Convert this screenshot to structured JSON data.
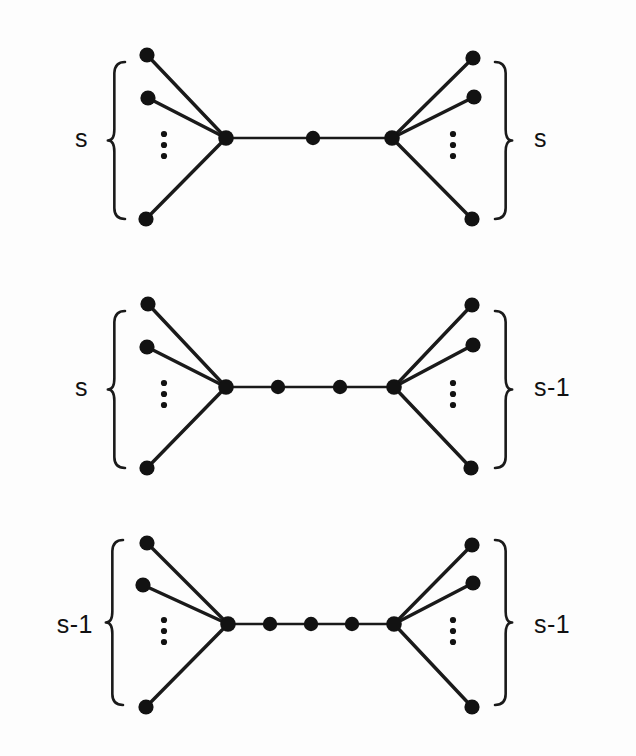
{
  "figure": {
    "background_color": "#fdfdfd",
    "ink_color": "#121212",
    "panel_count": 3,
    "ellipsis_glyph": "vertical-ellipsis",
    "panels": [
      {
        "id": "panel-top",
        "left_label": "s",
        "right_label": "s",
        "spine_internal_nodes": 1,
        "left_leaf_count_visible": 3,
        "right_leaf_count_visible": 3,
        "left_hub": {
          "x": 226,
          "y": 138
        },
        "right_hub": {
          "x": 392,
          "y": 138
        },
        "spine_nodes": [
          {
            "x": 313,
            "y": 138
          }
        ],
        "left_leaves": [
          {
            "x": 147,
            "y": 55
          },
          {
            "x": 148,
            "y": 98
          },
          {
            "x": 146,
            "y": 219
          }
        ],
        "right_leaves": [
          {
            "x": 473,
            "y": 58
          },
          {
            "x": 474,
            "y": 97
          },
          {
            "x": 472,
            "y": 219
          }
        ],
        "left_brace": {
          "x": 112,
          "top": 62,
          "bottom": 219
        },
        "right_brace": {
          "x": 508,
          "top": 62,
          "bottom": 219
        },
        "left_label_pos": {
          "x": 88,
          "y": 147
        },
        "right_label_pos": {
          "x": 534,
          "y": 147
        },
        "left_ellipsis": {
          "x": 164,
          "y": 145
        },
        "right_ellipsis": {
          "x": 453,
          "y": 145
        }
      },
      {
        "id": "panel-middle",
        "left_label": "s",
        "right_label": "s-1",
        "spine_internal_nodes": 2,
        "left_leaf_count_visible": 3,
        "right_leaf_count_visible": 3,
        "left_hub": {
          "x": 226,
          "y": 387
        },
        "right_hub": {
          "x": 394,
          "y": 387
        },
        "spine_nodes": [
          {
            "x": 278,
            "y": 387
          },
          {
            "x": 340,
            "y": 387
          }
        ],
        "left_leaves": [
          {
            "x": 148,
            "y": 304
          },
          {
            "x": 147,
            "y": 347
          },
          {
            "x": 147,
            "y": 468
          }
        ],
        "right_leaves": [
          {
            "x": 472,
            "y": 305
          },
          {
            "x": 473,
            "y": 345
          },
          {
            "x": 471,
            "y": 468
          }
        ],
        "left_brace": {
          "x": 112,
          "top": 311,
          "bottom": 468
        },
        "right_brace": {
          "x": 508,
          "top": 311,
          "bottom": 468
        },
        "left_label_pos": {
          "x": 88,
          "y": 396
        },
        "right_label_pos": {
          "x": 534,
          "y": 396
        },
        "left_ellipsis": {
          "x": 164,
          "y": 394
        },
        "right_ellipsis": {
          "x": 453,
          "y": 394
        }
      },
      {
        "id": "panel-bottom",
        "left_label": "s-1",
        "right_label": "s-1",
        "spine_internal_nodes": 3,
        "left_leaf_count_visible": 3,
        "right_leaf_count_visible": 3,
        "left_hub": {
          "x": 228,
          "y": 624
        },
        "right_hub": {
          "x": 394,
          "y": 624
        },
        "spine_nodes": [
          {
            "x": 270,
            "y": 624
          },
          {
            "x": 311,
            "y": 624
          },
          {
            "x": 352,
            "y": 624
          }
        ],
        "left_leaves": [
          {
            "x": 147,
            "y": 543
          },
          {
            "x": 143,
            "y": 585
          },
          {
            "x": 146,
            "y": 707
          }
        ],
        "right_leaves": [
          {
            "x": 472,
            "y": 545
          },
          {
            "x": 473,
            "y": 583
          },
          {
            "x": 472,
            "y": 707
          }
        ],
        "left_brace": {
          "x": 110,
          "top": 540,
          "bottom": 705
        },
        "right_brace": {
          "x": 508,
          "top": 540,
          "bottom": 705
        },
        "left_label_pos": {
          "x": 93,
          "y": 633
        },
        "right_label_pos": {
          "x": 534,
          "y": 633
        },
        "left_ellipsis": {
          "x": 164,
          "y": 631
        },
        "right_ellipsis": {
          "x": 453,
          "y": 631
        }
      }
    ]
  }
}
